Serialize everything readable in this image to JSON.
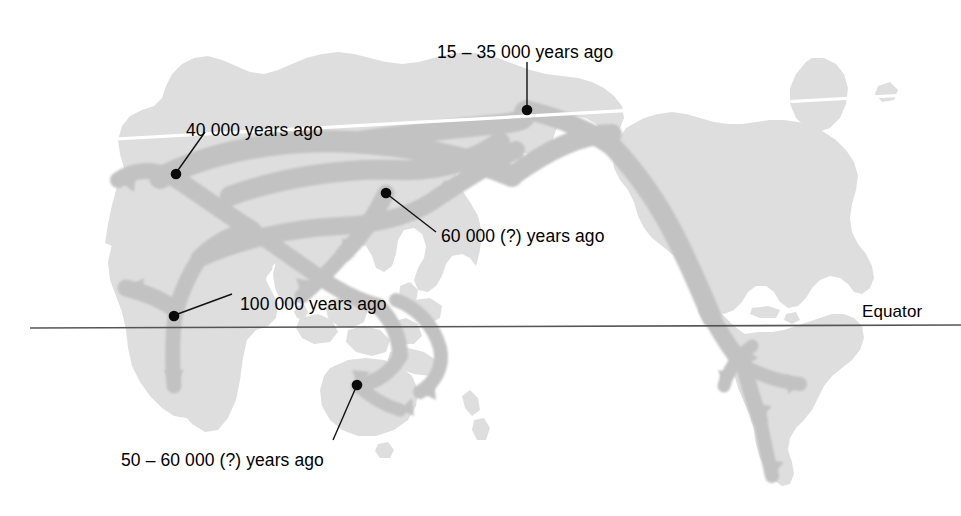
{
  "figure": {
    "type": "map",
    "background_color": "#ffffff",
    "land_color": "#dcdcdc",
    "arrow_color": "#c2c2c2",
    "line_color": "#555555",
    "arctic_line_color": "#ffffff",
    "text_color": "#000000"
  },
  "equator": {
    "label": "Equator",
    "line_y": 327,
    "line_x_start": 30,
    "line_x_end": 961
  },
  "annotations": [
    {
      "id": "bering",
      "text": "15 – 35 000 years ago",
      "label_x": 437,
      "label_y": 44,
      "dot_x": 527,
      "dot_y": 110,
      "leader": "vertical"
    },
    {
      "id": "europe",
      "text": "40 000 years ago",
      "label_x": 186,
      "label_y": 122,
      "dot_x": 176,
      "dot_y": 173,
      "leader": "down-left"
    },
    {
      "id": "east-asia",
      "text": "60 000 (?) years ago",
      "label_x": 441,
      "label_y": 228,
      "dot_x": 386,
      "dot_y": 193,
      "leader": "up-left"
    },
    {
      "id": "east-africa",
      "text": "100 000 years ago",
      "label_x": 240,
      "label_y": 296,
      "dot_x": 174,
      "dot_y": 315,
      "leader": "down-left"
    },
    {
      "id": "australia",
      "text": "50 – 60 000 (?) years ago",
      "label_x": 121,
      "label_y": 452,
      "dot_x": 357,
      "dot_y": 385,
      "leader": "up-right"
    }
  ]
}
